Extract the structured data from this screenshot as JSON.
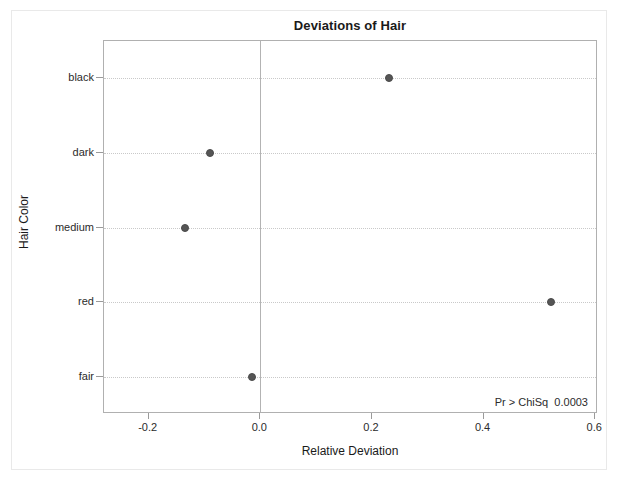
{
  "chart_data": {
    "type": "scatter",
    "title": "Deviations of Hair",
    "xlabel": "Relative Deviation",
    "ylabel": "Hair Color",
    "orientation": "horizontal",
    "categories": [
      "black",
      "dark",
      "medium",
      "red",
      "fair"
    ],
    "values": [
      0.23,
      -0.09,
      -0.135,
      0.52,
      -0.015
    ],
    "series": [
      {
        "name": "Relative Deviation",
        "points": [
          {
            "category": "black",
            "value": 0.23
          },
          {
            "category": "dark",
            "value": -0.09
          },
          {
            "category": "medium",
            "value": -0.135
          },
          {
            "category": "red",
            "value": 0.52
          },
          {
            "category": "fair",
            "value": -0.015
          }
        ]
      }
    ],
    "xlim": [
      -0.28,
      0.605
    ],
    "xticks": [
      -0.2,
      0.0,
      0.2,
      0.4,
      0.6
    ],
    "xtick_labels": [
      "-0.2",
      "0.0",
      "0.2",
      "0.4",
      "0.6"
    ],
    "ytick_labels": [
      "black",
      "dark",
      "medium",
      "red",
      "fair"
    ],
    "grid": "horizontal-dotted",
    "legend": "none",
    "reference_line_x": 0.0,
    "marker_color": "#555555",
    "gridline_color": "#c9c9c9",
    "axis_color": "#b0b0b0",
    "annotation": {
      "label": "Pr > ChiSq",
      "value": "0.0003",
      "text": "Pr > ChiSq  0.0003"
    }
  }
}
